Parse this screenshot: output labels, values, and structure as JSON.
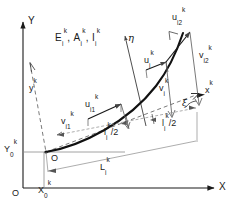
{
  "figure": {
    "kind": "engineering-diagram"
  },
  "global_axes": {
    "x_label": "X",
    "y_label": "Y",
    "origin_label": "O"
  },
  "local_axes": {
    "x_label": "x",
    "x_sup": "k",
    "y_label": "y",
    "y_sup": "k",
    "eta_label": "η",
    "node_origin_label": "O"
  },
  "angle": {
    "symbol": "ξ"
  },
  "material_props": {
    "text_parts": [
      {
        "base": "E",
        "sub": "i",
        "sup": "k"
      },
      {
        "sep": ", "
      },
      {
        "base": "A",
        "sub": "i",
        "sup": "k"
      },
      {
        "sep": ", "
      },
      {
        "base": "I",
        "sub": "i",
        "sup": "k"
      }
    ],
    "plain": "E_i^k, A_i^k, I_i^k"
  },
  "displacements": [
    {
      "name": "u-i1",
      "base": "u",
      "sub": "i1",
      "sup": "k",
      "plain": "u_i1^k"
    },
    {
      "name": "v-i1",
      "base": "v",
      "sub": "i1",
      "sup": "k",
      "plain": "v_i1^k"
    },
    {
      "name": "u-i",
      "base": "u",
      "sub": "i",
      "sup": "k",
      "plain": "u_i^k"
    },
    {
      "name": "v-i",
      "base": "v",
      "sub": "i",
      "sup": "k",
      "plain": "v_i^k"
    },
    {
      "name": "u-i2",
      "base": "u",
      "sub": "i2",
      "sup": "k",
      "plain": "u_i2^k"
    },
    {
      "name": "v-i2",
      "base": "v",
      "sub": "i2",
      "sup": "k",
      "plain": "v_i2^k"
    }
  ],
  "dimensions": [
    {
      "name": "half-length-left",
      "base": "l",
      "sub": "i",
      "sup": "k",
      "suffix": "/2",
      "plain": "l_i^k/2"
    },
    {
      "name": "half-length-right",
      "base": "l",
      "sub": "i",
      "sup": "k",
      "suffix": "/2",
      "plain": "l_i^k/2"
    },
    {
      "name": "chord-length",
      "base": "L",
      "sub": "i",
      "sup": "k",
      "suffix": "",
      "plain": "L_i^k"
    }
  ],
  "node_coordinates": [
    {
      "name": "x0",
      "base": "X",
      "sub": "0",
      "sup": "k",
      "plain": "X_0^k"
    },
    {
      "name": "y0",
      "base": "Y",
      "sub": "0",
      "sup": "k",
      "plain": "Y_0^k"
    }
  ],
  "colors": {
    "ink": "#1a1a1a",
    "thin": "#555555",
    "dashed": "#6b6b6b",
    "background": "#ffffff"
  }
}
